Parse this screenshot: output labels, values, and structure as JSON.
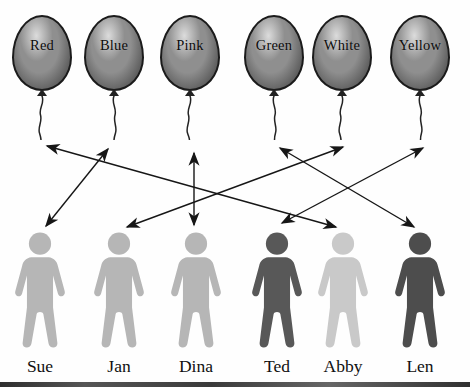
{
  "diagram": {
    "type": "matching"
  },
  "balloons": [
    {
      "label": "Red"
    },
    {
      "label": "Blue"
    },
    {
      "label": "Pink"
    },
    {
      "label": "Green"
    },
    {
      "label": "White"
    },
    {
      "label": "Yellow"
    }
  ],
  "people": [
    {
      "name": "Sue",
      "shade": "light"
    },
    {
      "name": "Jan",
      "shade": "light"
    },
    {
      "name": "Dina",
      "shade": "light"
    },
    {
      "name": "Ted",
      "shade": "dark"
    },
    {
      "name": "Abby",
      "shade": "lighter"
    },
    {
      "name": "Len",
      "shade": "darker"
    }
  ],
  "connections": [
    {
      "balloon": "Red",
      "person": "Abby"
    },
    {
      "balloon": "Blue",
      "person": "Sue"
    },
    {
      "balloon": "Pink",
      "person": "Dina"
    },
    {
      "balloon": "Green",
      "person": "Len"
    },
    {
      "balloon": "White",
      "person": "Jan"
    },
    {
      "balloon": "Yellow",
      "person": "Ted"
    }
  ],
  "colors": {
    "balloon_base": "#8f8f8f",
    "balloon_dark": "#454545",
    "balloon_highlight": "#dcdcdc",
    "figure_light": "#b6b6b6",
    "figure_lighter": "#c9c9c9",
    "figure_dark": "#585858",
    "figure_darker": "#4d4d4d",
    "line": "#161616"
  }
}
